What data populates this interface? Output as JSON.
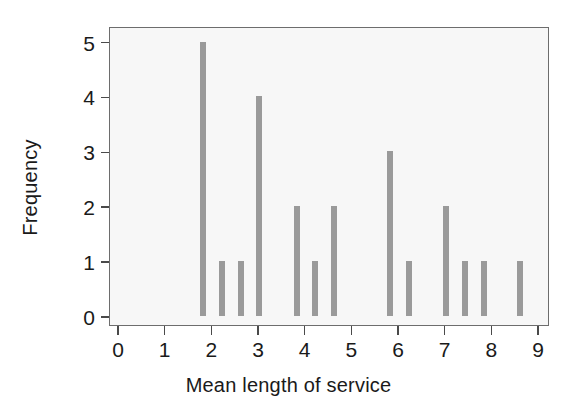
{
  "chart_data": {
    "type": "bar",
    "title": "",
    "xlabel": "Mean length of service",
    "ylabel": "Frequency",
    "xlim": [
      0,
      9
    ],
    "ylim": [
      0,
      5.3
    ],
    "grid": false,
    "legend": null,
    "bar_color": "#9a9a9a",
    "plot_background": "#f7f7f7",
    "axis_color": "#4a4a4a",
    "x_ticks": [
      0,
      1,
      2,
      3,
      4,
      5,
      6,
      7,
      8,
      9
    ],
    "x_tick_labels": [
      "0",
      "1",
      "2",
      "3",
      "4",
      "5",
      "6",
      "7",
      "8",
      "9"
    ],
    "y_ticks": [
      0,
      1,
      2,
      3,
      4,
      5
    ],
    "y_tick_labels": [
      "0",
      "1",
      "2",
      "3",
      "4",
      "5"
    ],
    "x": [
      1.8,
      2.21,
      2.62,
      3.0,
      3.82,
      4.21,
      4.61,
      5.81,
      6.22,
      7.01,
      7.42,
      7.83,
      8.6
    ],
    "values": [
      5,
      1,
      1,
      4,
      2,
      1,
      2,
      3,
      1,
      2,
      1,
      1,
      1
    ],
    "bars": [
      {
        "x": 1.8,
        "value": 5
      },
      {
        "x": 2.21,
        "value": 1
      },
      {
        "x": 2.62,
        "value": 1
      },
      {
        "x": 3.0,
        "value": 4
      },
      {
        "x": 3.82,
        "value": 2
      },
      {
        "x": 4.21,
        "value": 1
      },
      {
        "x": 4.61,
        "value": 2
      },
      {
        "x": 5.81,
        "value": 3
      },
      {
        "x": 6.22,
        "value": 1
      },
      {
        "x": 7.01,
        "value": 2
      },
      {
        "x": 7.42,
        "value": 1
      },
      {
        "x": 7.83,
        "value": 1
      },
      {
        "x": 8.6,
        "value": 1
      }
    ]
  }
}
